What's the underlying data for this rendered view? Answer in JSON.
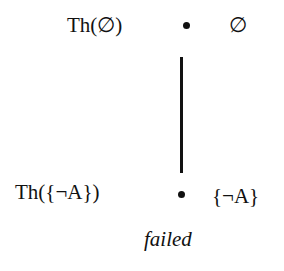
{
  "diagram": {
    "nodes": [
      {
        "id": "top",
        "theory_label": "Th(∅)",
        "set_label": "∅"
      },
      {
        "id": "bottom",
        "theory_label": "Th({¬A})",
        "set_label": "{¬A}"
      }
    ],
    "edges": [
      {
        "from": "top",
        "to": "bottom"
      }
    ],
    "caption": "failed"
  }
}
